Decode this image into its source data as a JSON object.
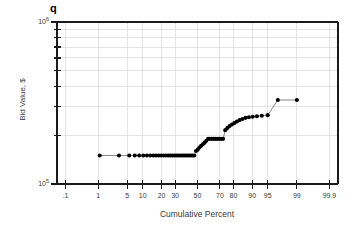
{
  "chart_data": {
    "type": "scatter",
    "title": "q",
    "subtitle": "",
    "xlabel": "Cumulative Percent",
    "ylabel": "Bid Value, $",
    "x_scale": "probability",
    "y_scale": "log",
    "ylim": [
      100000,
      1000000
    ],
    "xlim_percent": [
      0.05,
      99.95
    ],
    "grid": true,
    "legend": null,
    "marker": "filled-circle",
    "marker_color": "#000000",
    "line_color": "#555555",
    "grid_color": "#d9d9d9",
    "axis_color": "#1a1a1a",
    "background": "#ffffff",
    "y_tick_labels": [
      "10^6",
      "10^5"
    ],
    "y_tick_values": [
      1000000,
      100000
    ],
    "y_tick_mantissas": [
      "10",
      "10"
    ],
    "y_tick_exponents": [
      "6",
      "5"
    ],
    "x_tick_labels": [
      ".1",
      "1",
      "5",
      "10",
      "20",
      "30",
      "50",
      "70",
      "80",
      "90",
      "95",
      "99",
      "99.9"
    ],
    "x_tick_values": [
      0.1,
      1,
      5,
      10,
      20,
      30,
      50,
      70,
      80,
      90,
      95,
      99,
      99.9
    ],
    "series": [
      {
        "name": "bid values",
        "x": [
          1.1,
          3.3,
          5.5,
          7.1,
          8.6,
          10.2,
          11.8,
          13.4,
          15.0,
          16.6,
          18.2,
          19.8,
          21.4,
          23.0,
          24.6,
          26.2,
          27.8,
          29.4,
          31.0,
          32.6,
          34.2,
          35.8,
          37.4,
          39.0,
          40.6,
          42.2,
          43.8,
          45.4,
          47.0,
          48.6,
          50.2,
          51.8,
          53.4,
          55.0,
          56.6,
          58.2,
          59.8,
          61.4,
          63.0,
          64.6,
          66.2,
          67.8,
          69.4,
          71.0,
          72.6,
          74.2,
          75.8,
          77.4,
          79.0,
          80.6,
          82.2,
          83.8,
          85.4,
          87.0,
          88.6,
          90.2,
          91.8,
          93.4,
          95.0,
          97.0,
          99.0
        ],
        "y": [
          150000,
          150000,
          150000,
          150000,
          150000,
          150000,
          150000,
          150000,
          150000,
          150000,
          150000,
          150000,
          150000,
          150000,
          150000,
          150000,
          150000,
          150000,
          150000,
          150000,
          150000,
          150000,
          150000,
          150000,
          150000,
          150000,
          150000,
          150000,
          150000,
          160000,
          163000,
          168000,
          172000,
          176000,
          180000,
          185000,
          190000,
          190000,
          190000,
          190000,
          190000,
          190000,
          190000,
          190000,
          190000,
          215000,
          222000,
          228000,
          233000,
          238000,
          243000,
          248000,
          252000,
          256000,
          258000,
          260000,
          262000,
          264000,
          266000,
          330000,
          330000
        ]
      }
    ]
  }
}
